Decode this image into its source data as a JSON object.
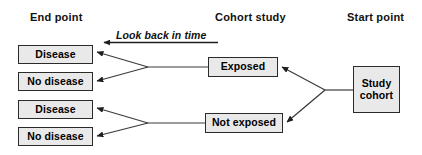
{
  "diagram": {
    "type": "flowchart",
    "colors": {
      "node_fill": "#e9e9e9",
      "node_border": "#2b2b2b",
      "line": "#333333",
      "text": "#000000",
      "background": "#ffffff"
    },
    "column_labels": {
      "end_point": "End point",
      "cohort_study": "Cohort study",
      "start_point": "Start point"
    },
    "time_arrow": {
      "label": "Look back in time",
      "direction": "left"
    },
    "nodes": {
      "start": {
        "label": "Study\ncohort"
      },
      "exposure": [
        {
          "label": "Exposed"
        },
        {
          "label": "Not exposed"
        }
      ],
      "outcomes": [
        {
          "label": "Disease"
        },
        {
          "label": "No disease"
        },
        {
          "label": "Disease"
        },
        {
          "label": "No disease"
        }
      ]
    },
    "edges": [
      {
        "from": "Study cohort",
        "to": "Exposed"
      },
      {
        "from": "Study cohort",
        "to": "Not exposed"
      },
      {
        "from": "Exposed",
        "to": "Disease"
      },
      {
        "from": "Exposed",
        "to": "No disease"
      },
      {
        "from": "Not exposed",
        "to": "Disease"
      },
      {
        "from": "Not exposed",
        "to": "No disease"
      }
    ]
  }
}
